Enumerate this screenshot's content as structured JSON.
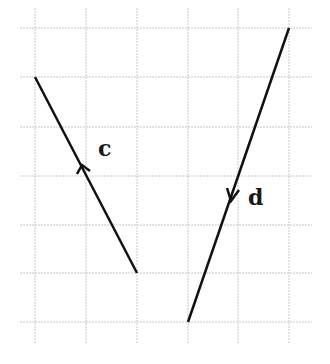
{
  "diagram": {
    "type": "vector-grid",
    "grid": {
      "x_lines": [
        35,
        86,
        137,
        188,
        238,
        289
      ],
      "y_lines": [
        28,
        77,
        127,
        176,
        225,
        273,
        322
      ],
      "x_extent": [
        20,
        312
      ],
      "y_extent": [
        8,
        343
      ],
      "color": "#c8c8c8"
    },
    "vectors": [
      {
        "label": "c",
        "start": [
          137,
          273
        ],
        "end": [
          35,
          77
        ],
        "arrow_at": [
          82,
          168
        ],
        "direction": "up-left",
        "label_pos": [
          98,
          156
        ]
      },
      {
        "label": "d",
        "start": [
          289,
          28
        ],
        "end": [
          188,
          322
        ],
        "arrow_at": [
          232,
          198
        ],
        "direction": "down-left",
        "label_pos": [
          248,
          205
        ]
      }
    ],
    "line_color": "#111111"
  }
}
